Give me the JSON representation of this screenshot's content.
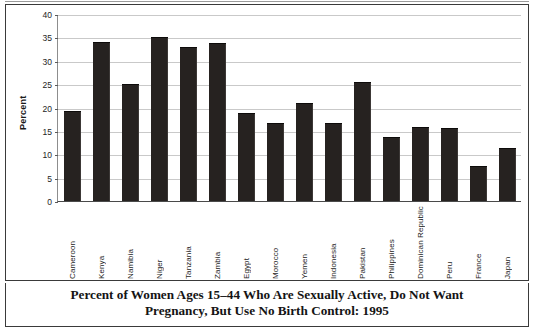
{
  "chart_data": {
    "type": "bar",
    "title": "Percent of Women Ages 15–44 Who Are Sexually Active, Do Not Want Pregnancy, But Use No Birth Control: 1995",
    "title_line1": "Percent of Women Ages 15–44 Who Are Sexually Active, Do Not Want",
    "title_line2": "Pregnancy, But Use No Birth Control: 1995",
    "xlabel": "",
    "ylabel": "Percent",
    "ylim": [
      0,
      40
    ],
    "ytick_step": 5,
    "yticks": [
      0,
      5,
      10,
      15,
      20,
      25,
      30,
      35,
      40
    ],
    "grid": true,
    "legend": "none",
    "bar_color": "#262220",
    "categories": [
      "Cameroon",
      "Kenya",
      "Namibia",
      "Niger",
      "Tanzania",
      "Zambia",
      "Egypt",
      "Morocco",
      "Yemen",
      "Indonesia",
      "Pakistan",
      "Philippines",
      "Dominican Republic",
      "Peru",
      "France",
      "Japan"
    ],
    "values": [
      19.0,
      33.9,
      24.8,
      34.8,
      32.8,
      33.6,
      18.7,
      16.5,
      20.7,
      16.5,
      25.2,
      13.5,
      15.7,
      15.5,
      7.3,
      11.2
    ]
  }
}
